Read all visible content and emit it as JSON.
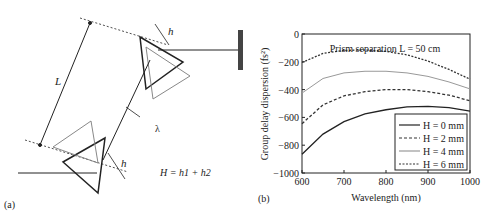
{
  "panel_a": {
    "label": "(a)",
    "L_label": "L",
    "h1_label": "h",
    "h1_sub": "1",
    "h2_label": "h",
    "h2_sub": "2",
    "lambda_label": "λ",
    "lambda_sub": "B",
    "equation": "H = h1 + h2"
  },
  "panel_b": {
    "label": "(b)"
  },
  "chart_data": {
    "type": "line",
    "title": "",
    "annotation": "Prism separation L = 50 cm",
    "xlabel": "Wavelength (nm)",
    "ylabel": "Group delay dispersion (fs²)",
    "xlim": [
      600,
      1000
    ],
    "ylim": [
      -1000,
      0
    ],
    "xticks": [
      600,
      700,
      800,
      900,
      1000
    ],
    "yticks": [
      0,
      -200,
      -400,
      -600,
      -800,
      -1000
    ],
    "legend_position": "lower right",
    "x": [
      600,
      650,
      700,
      750,
      800,
      850,
      900,
      950,
      1000
    ],
    "series": [
      {
        "name": "H = 0 mm",
        "style": "solid",
        "color": "#222222",
        "values": [
          -865,
          -720,
          -630,
          -575,
          -545,
          -525,
          -520,
          -530,
          -555
        ]
      },
      {
        "name": "H = 2 mm",
        "style": "dashed",
        "color": "#333333",
        "values": [
          -645,
          -510,
          -445,
          -415,
          -400,
          -400,
          -415,
          -440,
          -480
        ]
      },
      {
        "name": "H = 4 mm",
        "style": "solid",
        "color": "#999999",
        "values": [
          -425,
          -320,
          -280,
          -268,
          -268,
          -280,
          -305,
          -345,
          -395
        ]
      },
      {
        "name": "H = 6 mm",
        "style": "dashdot",
        "color": "#333333",
        "values": [
          -205,
          -140,
          -118,
          -115,
          -125,
          -150,
          -195,
          -255,
          -325
        ]
      }
    ]
  }
}
